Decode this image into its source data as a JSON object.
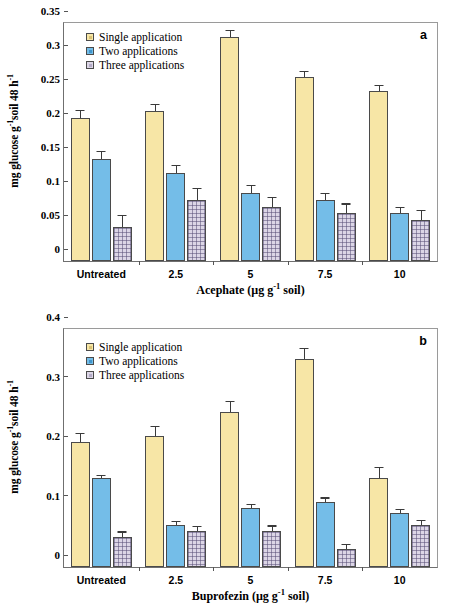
{
  "figure": {
    "width": 452,
    "height": 612,
    "background": "#ffffff",
    "series_colors": {
      "single": "#f7e6a6",
      "two": "#74bde8",
      "three": "#dcd6e6",
      "bar_outline": "#4a4a4a",
      "error_bar": "#3a3a3a",
      "axis": "#6f6f6f"
    },
    "legend_labels": {
      "single": "Single application",
      "two": "Two applications",
      "three": "Three applications"
    },
    "y_axis_label_parts": {
      "pre": "mg glucose g",
      "sup1": "-1",
      "mid": "soil 48 h",
      "sup2": "-1"
    }
  },
  "chart_data": [
    {
      "type": "bar",
      "panel": "a",
      "panel_letter": "a",
      "title": "",
      "xlabel": "Acephate (µg g-1 soil)",
      "xlabel_parts": {
        "pre": "Acephate (µg g",
        "sup": "-1",
        "post": " soil)"
      },
      "ylabel": "mg glucose g-1soil 48 h-1",
      "ylim": [
        0,
        0.35
      ],
      "yticks": [
        0,
        0.05,
        0.1,
        0.15,
        0.2,
        0.25,
        0.3,
        0.35
      ],
      "ytick_labels": [
        "0",
        "0.05",
        "0.1",
        "0.15",
        "0.2",
        "0.25",
        "0.3",
        "0.35"
      ],
      "grid": false,
      "legend_position": "top-left",
      "categories": [
        "Untreated",
        "2.5",
        "5",
        "7.5",
        "10"
      ],
      "series": [
        {
          "name": "Single application",
          "key": "single",
          "values": [
            0.21,
            0.22,
            0.33,
            0.27,
            0.25
          ],
          "errors": [
            0.01,
            0.01,
            0.008,
            0.008,
            0.007
          ]
        },
        {
          "name": "Two applications",
          "key": "two",
          "values": [
            0.15,
            0.13,
            0.1,
            0.09,
            0.07
          ],
          "errors": [
            0.01,
            0.01,
            0.01,
            0.008,
            0.008
          ]
        },
        {
          "name": "Three applications",
          "key": "three",
          "values": [
            0.05,
            0.09,
            0.08,
            0.07,
            0.06
          ],
          "errors": [
            0.016,
            0.016,
            0.013,
            0.013,
            0.014
          ]
        }
      ]
    },
    {
      "type": "bar",
      "panel": "b",
      "panel_letter": "b",
      "title": "",
      "xlabel": "Buprofezin (µg g-1 soil)",
      "xlabel_parts": {
        "pre": "Buprofezin (µg g",
        "sup": "-1",
        "post": " soil)"
      },
      "ylabel": "mg glucose g-1soil 48 h-1",
      "ylim": [
        0,
        0.4
      ],
      "yticks": [
        0,
        0.1,
        0.2,
        0.3,
        0.4
      ],
      "ytick_labels": [
        "0",
        "0.1",
        "0.2",
        "0.3",
        "0.4"
      ],
      "grid": false,
      "legend_position": "top-left",
      "categories": [
        "Untreated",
        "2.5",
        "5",
        "7.5",
        "10"
      ],
      "series": [
        {
          "name": "Single application",
          "key": "single",
          "values": [
            0.21,
            0.22,
            0.26,
            0.35,
            0.15
          ],
          "errors": [
            0.014,
            0.016,
            0.018,
            0.017,
            0.017
          ]
        },
        {
          "name": "Two applications",
          "key": "two",
          "values": [
            0.15,
            0.07,
            0.1,
            0.11,
            0.09
          ],
          "errors": [
            0.003,
            0.005,
            0.004,
            0.005,
            0.005
          ]
        },
        {
          "name": "Three applications",
          "key": "three",
          "values": [
            0.05,
            0.06,
            0.06,
            0.03,
            0.07
          ],
          "errors": [
            0.008,
            0.007,
            0.008,
            0.007,
            0.008
          ]
        }
      ]
    }
  ]
}
